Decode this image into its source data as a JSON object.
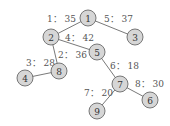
{
  "diagram": {
    "type": "tree",
    "nodes": [
      {
        "id": "1",
        "x": 88,
        "y": 18
      },
      {
        "id": "2",
        "x": 51,
        "y": 37
      },
      {
        "id": "3",
        "x": 135,
        "y": 37
      },
      {
        "id": "5",
        "x": 97,
        "y": 52
      },
      {
        "id": "8",
        "x": 59,
        "y": 71
      },
      {
        "id": "4",
        "x": 25,
        "y": 78
      },
      {
        "id": "7",
        "x": 120,
        "y": 84
      },
      {
        "id": "6",
        "x": 150,
        "y": 100
      },
      {
        "id": "9",
        "x": 97,
        "y": 111
      }
    ],
    "edges": [
      {
        "from": "1",
        "to": "2",
        "label": "1： 35",
        "lx": 47,
        "ly": 22
      },
      {
        "from": "1",
        "to": "3",
        "label": "5： 37",
        "lx": 104,
        "ly": 22
      },
      {
        "from": "2",
        "to": "5",
        "label": "4： 42",
        "lx": 65,
        "ly": 41
      },
      {
        "from": "2",
        "to": "8",
        "label": "2： 36",
        "lx": 58,
        "ly": 58
      },
      {
        "from": "8",
        "to": "4",
        "label": "3： 28",
        "lx": 26,
        "ly": 66
      },
      {
        "from": "5",
        "to": "7",
        "label": "6： 18",
        "lx": 110,
        "ly": 69
      },
      {
        "from": "7",
        "to": "6",
        "label": "8： 30",
        "lx": 135,
        "ly": 87
      },
      {
        "from": "7",
        "to": "9",
        "label": "7： 20",
        "lx": 84,
        "ly": 96
      }
    ]
  }
}
